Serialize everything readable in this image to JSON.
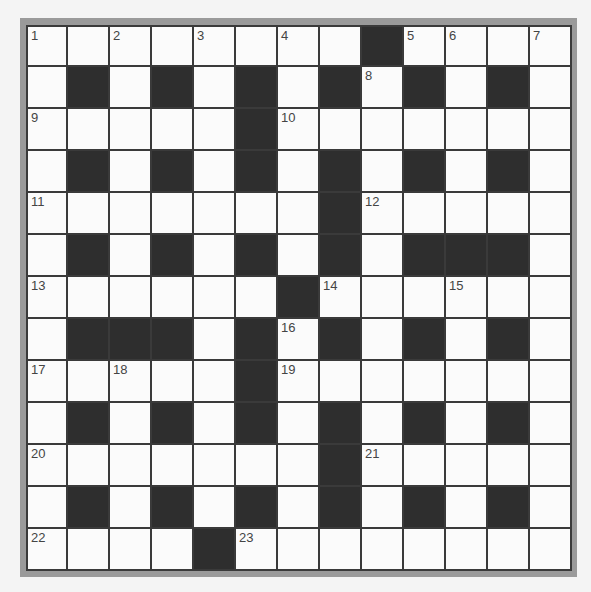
{
  "puzzle": {
    "size": 13,
    "colors": {
      "background": "#f4f4f4",
      "frame": "#9a9a9a",
      "white_cell": "#fbfbfb",
      "black_cell": "#2e2e2e",
      "grid_line": "#3a3a3a",
      "number": "#444444"
    },
    "rows": [
      "........#....",
      ".#.#.#.#.#.#.",
      ".....#.......",
      ".#.#.#.#.#.#.",
      ".......#.....",
      ".#.#.#.#.###.",
      "......#......",
      ".###.#.#.#.#.",
      ".....#.......",
      ".#.#.#.#.#.#.",
      ".......#.....",
      ".#.#.#.#.#.#.",
      "....#........"
    ],
    "numbers": [
      {
        "n": "1",
        "row": 0,
        "col": 0
      },
      {
        "n": "2",
        "row": 0,
        "col": 2
      },
      {
        "n": "3",
        "row": 0,
        "col": 4
      },
      {
        "n": "4",
        "row": 0,
        "col": 6
      },
      {
        "n": "5",
        "row": 0,
        "col": 9
      },
      {
        "n": "6",
        "row": 0,
        "col": 10
      },
      {
        "n": "7",
        "row": 0,
        "col": 12
      },
      {
        "n": "8",
        "row": 1,
        "col": 8
      },
      {
        "n": "9",
        "row": 2,
        "col": 0
      },
      {
        "n": "10",
        "row": 2,
        "col": 6
      },
      {
        "n": "11",
        "row": 4,
        "col": 0
      },
      {
        "n": "12",
        "row": 4,
        "col": 8
      },
      {
        "n": "13",
        "row": 6,
        "col": 0
      },
      {
        "n": "14",
        "row": 6,
        "col": 7
      },
      {
        "n": "15",
        "row": 6,
        "col": 10
      },
      {
        "n": "16",
        "row": 7,
        "col": 6
      },
      {
        "n": "17",
        "row": 8,
        "col": 0
      },
      {
        "n": "18",
        "row": 8,
        "col": 2
      },
      {
        "n": "19",
        "row": 8,
        "col": 6
      },
      {
        "n": "20",
        "row": 10,
        "col": 0
      },
      {
        "n": "21",
        "row": 10,
        "col": 8
      },
      {
        "n": "22",
        "row": 12,
        "col": 0
      },
      {
        "n": "23",
        "row": 12,
        "col": 5
      }
    ]
  }
}
